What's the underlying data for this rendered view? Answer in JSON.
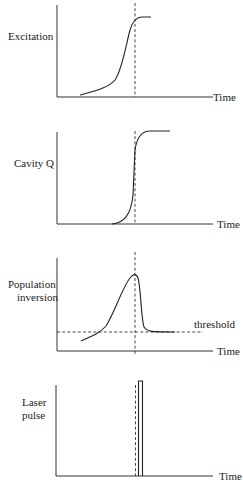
{
  "diagram": {
    "time_axis_label": "Time",
    "panels": [
      {
        "id": "excitation",
        "label_lines": [
          "Excitation"
        ],
        "curve": "sigmoid rise saturating at the Q-switch instant"
      },
      {
        "id": "cavity-q",
        "label_lines": [
          "Cavity Q"
        ],
        "curve": "abrupt step from low to high at the Q-switch instant"
      },
      {
        "id": "population-inversion",
        "label_lines": [
          "Population",
          "inversion"
        ],
        "curve": "rises to peak at Q-switch instant then drops to threshold",
        "threshold_label": "threshold"
      },
      {
        "id": "laser-pulse",
        "label_lines": [
          "Laser",
          "pulse"
        ],
        "curve": "narrow rectangular pulse just after Q-switch instant"
      }
    ]
  }
}
